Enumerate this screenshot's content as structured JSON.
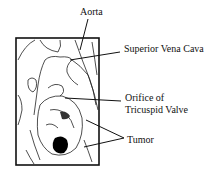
{
  "diagram": {
    "labels": {
      "aorta": "Aorta",
      "svc": "Superior Vena Cava",
      "orifice_line1": "Orifice of",
      "orifice_line2": "Tricuspid Valve",
      "tumor": "Tumor"
    },
    "colors": {
      "line": "#111111",
      "background": "#ffffff",
      "tumor_fill": "#000000"
    }
  }
}
